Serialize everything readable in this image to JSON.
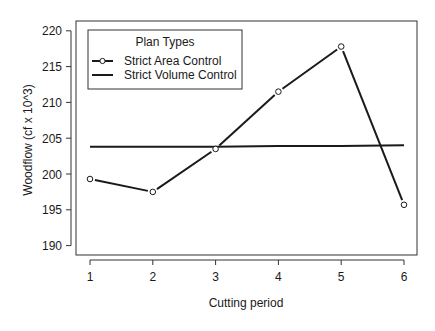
{
  "chart_data": {
    "type": "line",
    "title": "",
    "xlabel": "Cutting period",
    "ylabel": "Woodflow (cf x 10^3)",
    "x": [
      1,
      2,
      3,
      4,
      5,
      6
    ],
    "xticks": [
      "1",
      "2",
      "3",
      "4",
      "5",
      "6"
    ],
    "yticks": [
      "190",
      "195",
      "200",
      "205",
      "210",
      "215",
      "220"
    ],
    "ylim": [
      189,
      221
    ],
    "xlim": [
      0.78,
      6.21
    ],
    "grid": false,
    "legend": {
      "title": "Plan Types",
      "position": "top-left",
      "entries": [
        "Strict Area Control",
        "Strict Volume Control"
      ]
    },
    "series": [
      {
        "name": "Strict Area Control",
        "style": "line-with-open-circles",
        "values": [
          199.3,
          197.5,
          203.5,
          211.5,
          217.8,
          195.7
        ]
      },
      {
        "name": "Strict Volume Control",
        "style": "line",
        "values": [
          203.8,
          203.8,
          203.8,
          203.9,
          203.9,
          204.0
        ]
      }
    ],
    "colors": {
      "line": "#1a1a1a",
      "frame": "#333333",
      "background": "#ffffff"
    }
  }
}
